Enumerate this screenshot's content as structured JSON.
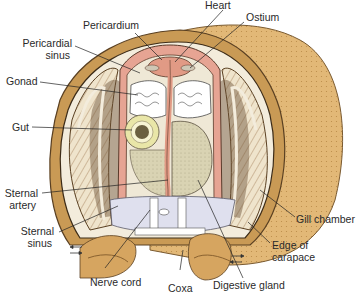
{
  "diagram": {
    "colors": {
      "carapace": "#e2b877",
      "carapace_dark": "#c99a55",
      "gill": "#e8dcc4",
      "gill_dark": "#6b5035",
      "vessel": "#e6a493",
      "gonad": "#ffffff",
      "gut": "#e9e6a8",
      "digestive_gland": "#d8d3b5",
      "sinus": "#dfe0ee",
      "line": "#222222"
    },
    "labels": {
      "heart": "Heart",
      "ostium": "Ostium",
      "pericardium": "Pericardium",
      "pericardial_sinus_1": "Pericardial",
      "pericardial_sinus_2": "sinus",
      "gonad": "Gonad",
      "gut": "Gut",
      "sternal_artery_1": "Sternal",
      "sternal_artery_2": "artery",
      "sternal_sinus_1": "Sternal",
      "sternal_sinus_2": "sinus",
      "nerve_cord": "Nerve cord",
      "coxa": "Coxa",
      "digestive_gland": "Digestive gland",
      "gill_chamber": "Gill chamber",
      "edge_of_carapace_1": "Edge of",
      "edge_of_carapace_2": "carapace"
    }
  }
}
